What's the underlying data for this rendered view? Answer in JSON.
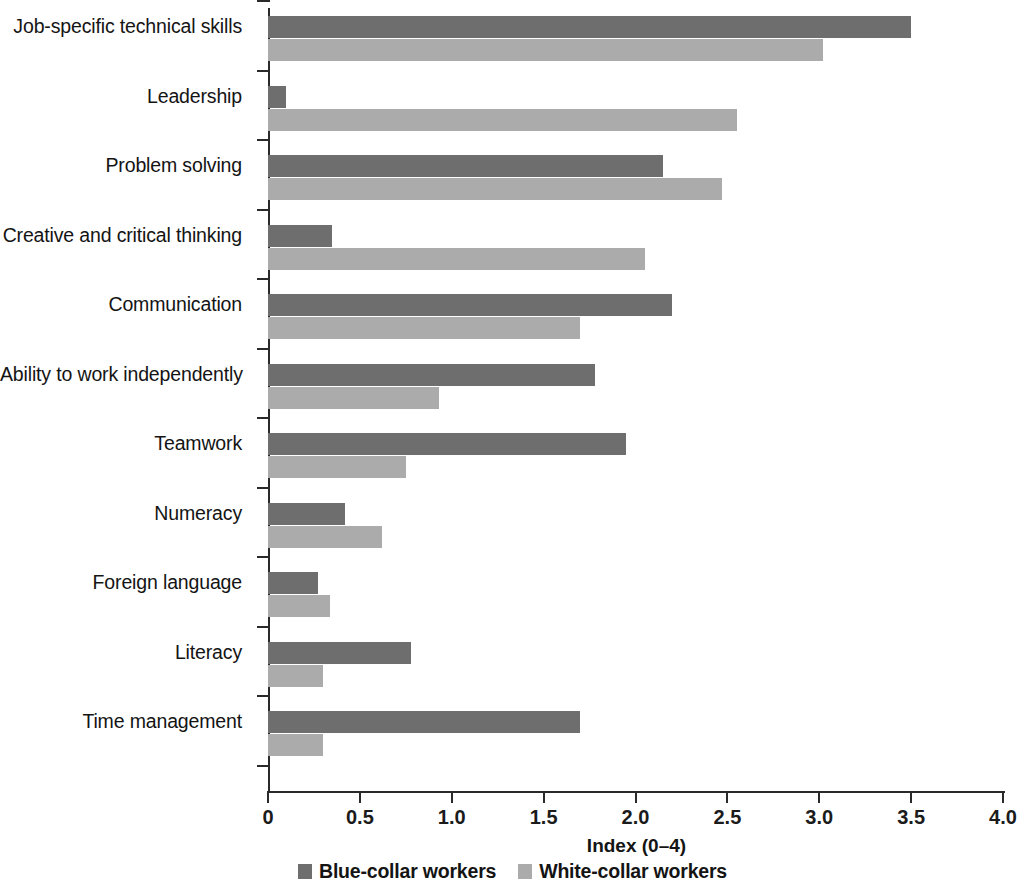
{
  "chart_data": {
    "type": "bar",
    "orientation": "horizontal",
    "title": "",
    "xlabel": "Index (0–4)",
    "ylabel": "",
    "xlim": [
      0,
      4
    ],
    "xticks": [
      "0",
      "0.5",
      "1.0",
      "1.5",
      "2.0",
      "2.5",
      "3.0",
      "3.5",
      "4.0"
    ],
    "xtick_values": [
      0,
      0.5,
      1.0,
      1.5,
      2.0,
      2.5,
      3.0,
      3.5,
      4.0
    ],
    "grid": false,
    "legend_position": "bottom-center",
    "categories": [
      "Job-specific technical skills",
      "Leadership",
      "Problem solving",
      "Creative and critical thinking",
      "Communication",
      "Ability to work independently",
      "Teamwork",
      "Numeracy",
      "Foreign language",
      "Literacy",
      "Time management"
    ],
    "series": [
      {
        "name": "Blue-collar workers",
        "color": "#6e6e6e",
        "values": [
          3.5,
          0.1,
          2.15,
          0.35,
          2.2,
          1.78,
          1.95,
          0.42,
          0.27,
          0.78,
          1.7
        ]
      },
      {
        "name": "White-collar workers",
        "color": "#ababab",
        "values": [
          3.02,
          2.55,
          2.47,
          2.05,
          1.7,
          0.93,
          0.75,
          0.62,
          0.34,
          0.3,
          0.3
        ]
      }
    ]
  },
  "axis": {
    "x_title": "Index (0–4)"
  },
  "legend": {
    "items": [
      {
        "label": "Blue-collar workers",
        "color": "#6e6e6e"
      },
      {
        "label": "White-collar workers",
        "color": "#ababab"
      }
    ]
  }
}
